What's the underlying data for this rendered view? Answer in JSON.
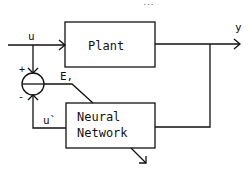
{
  "diagram": {
    "type": "block-diagram",
    "page_mark": "...",
    "blocks": [
      {
        "id": "plant",
        "label": "Plant"
      },
      {
        "id": "nn",
        "label_line1": "Neural",
        "label_line2": "Network"
      }
    ],
    "signals": {
      "input": "u",
      "output": "y",
      "error": "E,",
      "nn_output": "u`",
      "plus_sign": "+",
      "minus_sign": "-"
    },
    "connections": [
      {
        "from": "u",
        "to": "plant"
      },
      {
        "from": "u",
        "to": "summing-junction",
        "sign": "+"
      },
      {
        "from": "nn",
        "to": "summing-junction",
        "sign": "-",
        "label": "u`"
      },
      {
        "from": "plant",
        "to": "y"
      },
      {
        "from": "y",
        "to": "nn",
        "type": "feedback"
      },
      {
        "from": "summing-junction",
        "to": "nn",
        "label": "E,"
      },
      {
        "from": "nn",
        "to": "out",
        "type": "adaptation-arrow"
      }
    ],
    "colors": {
      "stroke": "#111111",
      "background": "#ffffff"
    }
  }
}
